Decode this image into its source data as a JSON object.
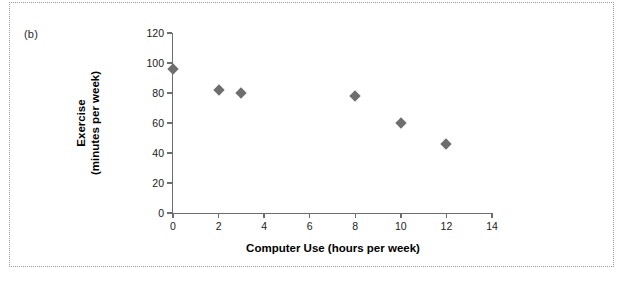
{
  "figure": {
    "panel_label": "(b)",
    "marker_color": "#6e6e6e",
    "axis_color": "#6d6d6d",
    "frame_style": "dotted"
  },
  "chart_data": {
    "type": "scatter",
    "title": "",
    "xlabel": "Computer Use (hours per week)",
    "ylabel_line1": "Exercise",
    "ylabel_line2": "(minutes per week)",
    "xlim": [
      0,
      14
    ],
    "ylim": [
      0,
      120
    ],
    "xticks": [
      0,
      2,
      4,
      6,
      8,
      10,
      12,
      14
    ],
    "yticks": [
      0,
      20,
      40,
      60,
      80,
      100,
      120
    ],
    "xtick_labels": [
      "0",
      "2",
      "4",
      "6",
      "8",
      "10",
      "12",
      "14"
    ],
    "ytick_labels": [
      "0",
      "20",
      "40",
      "60",
      "80",
      "100",
      "120"
    ],
    "grid": false,
    "legend": false,
    "series": [
      {
        "name": "Exercise vs Computer Use",
        "marker": "diamond",
        "color": "#6e6e6e",
        "points": [
          {
            "x": 0,
            "y": 96
          },
          {
            "x": 2,
            "y": 82
          },
          {
            "x": 3,
            "y": 80
          },
          {
            "x": 8,
            "y": 78
          },
          {
            "x": 10,
            "y": 60
          },
          {
            "x": 12,
            "y": 46
          }
        ]
      }
    ]
  }
}
